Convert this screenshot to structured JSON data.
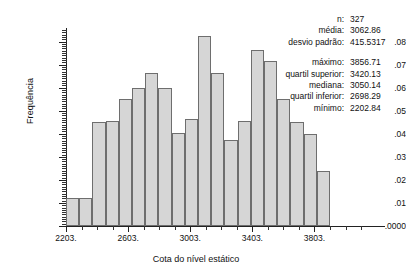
{
  "chart_data": {
    "type": "bar",
    "title": "",
    "subtitle": "",
    "xlabel": "Cota do nível estático",
    "ylabel": "Frequência",
    "xlim": [
      2203,
      3903
    ],
    "ylim": [
      0,
      0.085
    ],
    "bin_width": 85,
    "grid": false,
    "legend": null,
    "xtick_labels": [
      "2203.",
      "2603.",
      "3003.",
      "3403.",
      "3803."
    ],
    "xtick_values": [
      2203,
      2603,
      3003,
      3403,
      3803
    ],
    "ytick_labels": [
      ".0000",
      ".01",
      ".02",
      ".03",
      ".04",
      ".05",
      ".06",
      ".07",
      ".08"
    ],
    "ytick_values": [
      0.0,
      0.01,
      0.02,
      0.03,
      0.04,
      0.05,
      0.06,
      0.07,
      0.08
    ],
    "bin_starts": [
      2203,
      2288,
      2373,
      2458,
      2543,
      2628,
      2713,
      2798,
      2883,
      2968,
      3053,
      3138,
      3223,
      3308,
      3393,
      3478,
      3563,
      3648,
      3733,
      3818
    ],
    "categories": [
      "2203-2288",
      "2288-2373",
      "2373-2458",
      "2458-2543",
      "2543-2628",
      "2628-2713",
      "2713-2798",
      "2798-2883",
      "2883-2968",
      "2968-3053",
      "3053-3138",
      "3138-3223",
      "3223-3308",
      "3308-3393",
      "3393-3478",
      "3478-3563",
      "3563-3648",
      "3648-3733",
      "3733-3818",
      "3818-3903"
    ],
    "values": [
      0.012,
      0.012,
      0.045,
      0.0455,
      0.055,
      0.06,
      0.0665,
      0.06,
      0.0405,
      0.0465,
      0.0825,
      0.0665,
      0.0375,
      0.0455,
      0.0765,
      0.0715,
      0.055,
      0.045,
      0.04,
      0.024
    ]
  },
  "stats": {
    "group1": [
      {
        "key": "n:",
        "value": "327"
      },
      {
        "key": "média:",
        "value": "3062.86"
      },
      {
        "key": "desvio padrão:",
        "value": "415.5317"
      }
    ],
    "group2": [
      {
        "key": "máximo:",
        "value": "3856.71"
      },
      {
        "key": "quartil superior:",
        "value": "3420.13"
      },
      {
        "key": "mediana:",
        "value": "3050.14"
      },
      {
        "key": "quartil inferior:",
        "value": "2698.29"
      },
      {
        "key": "mínimo:",
        "value": "2202.84"
      }
    ]
  },
  "colors": {
    "bar_fill": "#d6d6d6",
    "bar_stroke": "#6e6e6e",
    "axis": "#222222",
    "text": "#111111",
    "background": "#ffffff"
  }
}
